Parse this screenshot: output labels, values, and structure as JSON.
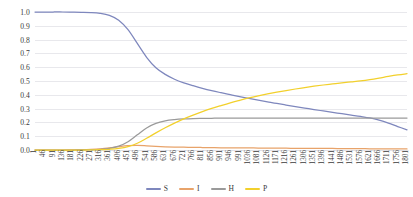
{
  "chart_data": {
    "type": "line",
    "title": "",
    "xlabel": "",
    "ylabel": "",
    "xlim": [
      1,
      1801
    ],
    "ylim": [
      0.0,
      1.0
    ],
    "grid": true,
    "legend_position": "bottom",
    "y_ticks": [
      "1.0",
      "0.9",
      "0.8",
      "0.7",
      "0.6",
      "0.5",
      "0.4",
      "0.3",
      "0.2",
      "0.1",
      "0.0"
    ],
    "y_tick_values": [
      1.0,
      0.9,
      0.8,
      0.7,
      0.6,
      0.5,
      0.4,
      0.3,
      0.2,
      0.1,
      0.0
    ],
    "categories": [
      "1",
      "46",
      "91",
      "136",
      "181",
      "226",
      "271",
      "316",
      "361",
      "406",
      "451",
      "496",
      "541",
      "586",
      "631",
      "676",
      "721",
      "766",
      "811",
      "856",
      "901",
      "946",
      "991",
      "1036",
      "1081",
      "1126",
      "1171",
      "1216",
      "1261",
      "1306",
      "1351",
      "1396",
      "1441",
      "1486",
      "1531",
      "1576",
      "1621",
      "1666",
      "1711",
      "1756",
      "1801"
    ],
    "x": [
      1,
      46,
      91,
      136,
      181,
      226,
      271,
      316,
      361,
      406,
      451,
      496,
      541,
      586,
      631,
      676,
      721,
      766,
      811,
      856,
      901,
      946,
      991,
      1036,
      1081,
      1126,
      1171,
      1216,
      1261,
      1306,
      1351,
      1396,
      1441,
      1486,
      1531,
      1576,
      1621,
      1666,
      1711,
      1756,
      1801
    ],
    "series": [
      {
        "name": "S",
        "color": "#7e87bd",
        "values": [
          1.0,
          1.0,
          1.0,
          1.0,
          0.999,
          0.998,
          0.996,
          0.99,
          0.975,
          0.94,
          0.872,
          0.772,
          0.672,
          0.596,
          0.548,
          0.513,
          0.487,
          0.466,
          0.447,
          0.43,
          0.415,
          0.401,
          0.387,
          0.374,
          0.361,
          0.349,
          0.337,
          0.326,
          0.315,
          0.304,
          0.293,
          0.283,
          0.273,
          0.263,
          0.253,
          0.243,
          0.232,
          0.216,
          0.195,
          0.17,
          0.146
        ]
      },
      {
        "name": "I",
        "color": "#e8a36a",
        "values": [
          0.0,
          0.0,
          0.0,
          0.0,
          0.001,
          0.002,
          0.004,
          0.008,
          0.015,
          0.024,
          0.031,
          0.033,
          0.03,
          0.026,
          0.023,
          0.021,
          0.02,
          0.019,
          0.018,
          0.017,
          0.016,
          0.016,
          0.015,
          0.015,
          0.014,
          0.014,
          0.013,
          0.013,
          0.012,
          0.012,
          0.011,
          0.011,
          0.011,
          0.01,
          0.01,
          0.01,
          0.009,
          0.009,
          0.009,
          0.008,
          0.008
        ]
      },
      {
        "name": "H",
        "color": "#9a9a9a",
        "values": [
          0.0,
          0.0,
          0.0,
          0.0,
          0.0,
          0.001,
          0.002,
          0.005,
          0.012,
          0.028,
          0.06,
          0.11,
          0.16,
          0.193,
          0.211,
          0.22,
          0.225,
          0.228,
          0.229,
          0.23,
          0.231,
          0.231,
          0.231,
          0.231,
          0.231,
          0.231,
          0.231,
          0.231,
          0.231,
          0.231,
          0.231,
          0.231,
          0.231,
          0.231,
          0.231,
          0.231,
          0.231,
          0.231,
          0.231,
          0.231,
          0.231
        ]
      },
      {
        "name": "P",
        "color": "#f2d02c",
        "values": [
          0.0,
          0.0,
          0.0,
          0.0,
          0.0,
          0.0,
          0.001,
          0.002,
          0.005,
          0.011,
          0.024,
          0.049,
          0.085,
          0.124,
          0.161,
          0.195,
          0.226,
          0.253,
          0.278,
          0.301,
          0.322,
          0.342,
          0.36,
          0.377,
          0.392,
          0.406,
          0.419,
          0.431,
          0.442,
          0.452,
          0.462,
          0.471,
          0.479,
          0.487,
          0.494,
          0.501,
          0.51,
          0.521,
          0.533,
          0.544,
          0.553
        ]
      }
    ],
    "legend": [
      {
        "label": "S",
        "color": "#7e87bd"
      },
      {
        "label": "I",
        "color": "#e8a36a"
      },
      {
        "label": "H",
        "color": "#9a9a9a"
      },
      {
        "label": "P",
        "color": "#f2d02c"
      }
    ]
  }
}
